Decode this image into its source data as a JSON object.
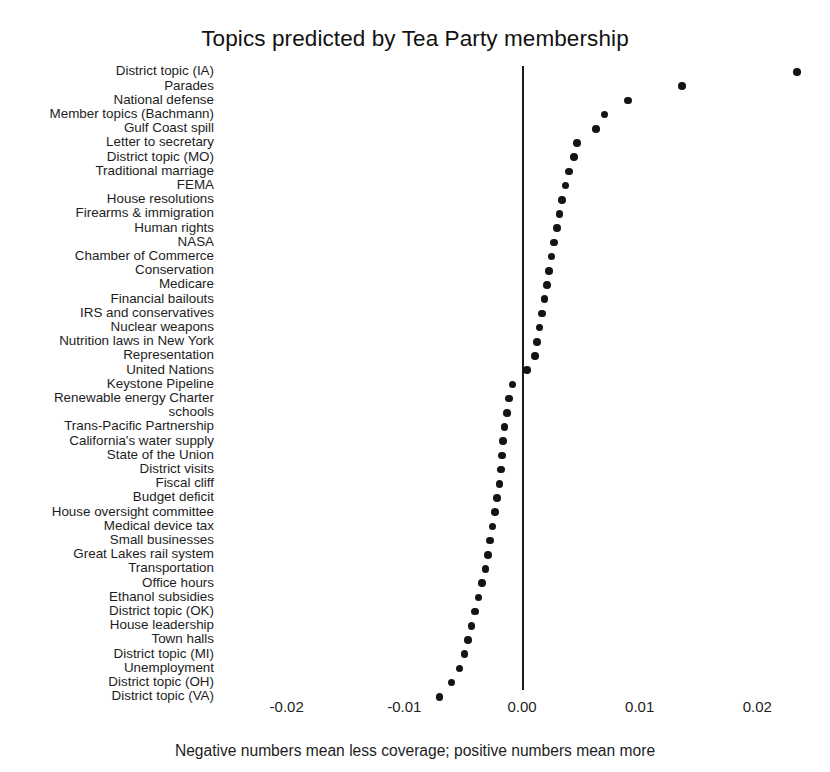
{
  "chart_data": {
    "type": "scatter",
    "title": "Topics predicted by Tea Party membership",
    "subtitle": "",
    "xlabel": "",
    "ylabel": "",
    "caption": "Negative numbers mean less coverage; positive numbers mean more",
    "grid": false,
    "legend": false,
    "xlim": [
      -0.0255,
      0.0255
    ],
    "xticks": [
      -0.02,
      -0.01,
      0.0,
      0.01,
      0.02
    ],
    "xtick_labels": [
      "-0.02",
      "-0.01",
      "0.00",
      "0.01",
      "0.02"
    ],
    "zero_reference_line": 0.0,
    "orientation": "horizontal",
    "point_color": "#141414",
    "axis_color": "#1b1b1b",
    "categories": [
      "District topic (IA)",
      "Parades",
      "National defense",
      "Member topics (Bachmann)",
      "Gulf Coast spill",
      "Letter to secretary",
      "District topic (MO)",
      "Traditional marriage",
      "FEMA",
      "House resolutions",
      "Firearms & immigration",
      "Human rights",
      "NASA",
      "Chamber of Commerce",
      "Conservation",
      "Medicare",
      "Financial bailouts",
      "IRS and conservatives",
      "Nuclear weapons",
      "Nutrition laws in New York",
      "Representation",
      "United Nations",
      "Keystone Pipeline",
      "Renewable energy Charter",
      "schools",
      "Trans-Pacific Partnership",
      "California's water supply",
      "State of the Union",
      "District visits",
      "Fiscal cliff",
      "Budget deficit",
      "House oversight committee",
      "Medical device tax",
      "Small businesses",
      "Great Lakes rail system",
      "Transportation",
      "Office hours",
      "Ethanol subsidies",
      "District topic (OK)",
      "House leadership",
      "Town halls",
      "District topic (MI)",
      "Unemployment",
      "District topic (OH)",
      "District topic (VA)"
    ],
    "values": [
      0.0234,
      0.0136,
      0.009,
      0.007,
      0.0063,
      0.0047,
      0.0044,
      0.004,
      0.0037,
      0.0034,
      0.0032,
      0.003,
      0.0027,
      0.0025,
      0.0023,
      0.0021,
      0.0019,
      0.0017,
      0.0015,
      0.0013,
      0.0011,
      0.0004,
      -0.0008,
      -0.0011,
      -0.0013,
      -0.0015,
      -0.0016,
      -0.0017,
      -0.0018,
      -0.0019,
      -0.0021,
      -0.0023,
      -0.0025,
      -0.0027,
      -0.0029,
      -0.0031,
      -0.0034,
      -0.0037,
      -0.004,
      -0.0043,
      -0.0046,
      -0.0049,
      -0.0053,
      -0.006,
      -0.007
    ]
  }
}
